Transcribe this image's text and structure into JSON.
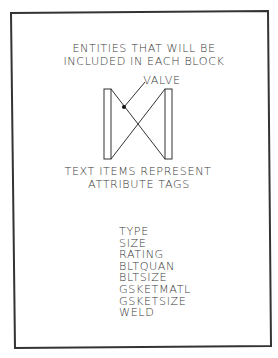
{
  "header": {
    "line1": "ENTITIES THAT WILL BE",
    "line2": "INCLUDED IN EACH BLOCK"
  },
  "symbol": {
    "label": "VALVE",
    "icon": "gate-valve-symbol"
  },
  "note": {
    "line1": "TEXT ITEMS REPRESENT",
    "line2": "ATTRIBUTE TAGS"
  },
  "attribute_tags": [
    "TYPE",
    "SIZE",
    "RATING",
    "BLTQUAN",
    "BLTSIZE",
    "GSKETMATL",
    "GSKETSIZE",
    "WELD"
  ],
  "colors": {
    "border": "#333333",
    "text": "#3a3a3a",
    "background": "#ffffff"
  }
}
